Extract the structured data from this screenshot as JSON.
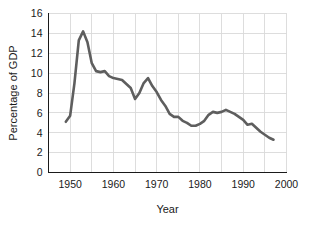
{
  "chart_data": {
    "type": "line",
    "title": "",
    "xlabel": "Year",
    "ylabel": "Percentage of GDP",
    "xlim": [
      1945,
      2000
    ],
    "ylim": [
      0,
      16
    ],
    "grid": true,
    "legend": false,
    "line_color": "#5e5e5e",
    "grid_color": "#d9d9d9",
    "axis_color": "#1a1a1a",
    "background_color": "#ffffff",
    "x_ticks": [
      1950,
      1960,
      1970,
      1980,
      1990,
      2000
    ],
    "x_tick_labels": [
      "1950",
      "1960",
      "1970",
      "1980",
      "1990",
      "2000"
    ],
    "x_minor_gridlines": [
      1945,
      1950,
      1955,
      1960,
      1965,
      1970,
      1975,
      1980,
      1985,
      1990,
      1995,
      2000
    ],
    "y_ticks": [
      0,
      2,
      4,
      6,
      8,
      10,
      12,
      14,
      16
    ],
    "y_tick_labels": [
      "0",
      "2",
      "4",
      "6",
      "8",
      "10",
      "12",
      "14",
      "16"
    ],
    "series": [
      {
        "name": "Defense spending",
        "x": [
          1949,
          1950,
          1951,
          1952,
          1953,
          1954,
          1955,
          1956,
          1957,
          1958,
          1959,
          1960,
          1961,
          1962,
          1963,
          1964,
          1965,
          1966,
          1967,
          1968,
          1969,
          1970,
          1971,
          1972,
          1973,
          1974,
          1975,
          1976,
          1977,
          1978,
          1979,
          1980,
          1981,
          1982,
          1983,
          1984,
          1985,
          1986,
          1987,
          1988,
          1989,
          1990,
          1991,
          1992,
          1993,
          1994,
          1995,
          1996,
          1997
        ],
        "values": [
          5.1,
          5.7,
          9.0,
          13.3,
          14.2,
          13.1,
          11.0,
          10.2,
          10.1,
          10.2,
          9.7,
          9.5,
          9.4,
          9.3,
          8.9,
          8.5,
          7.4,
          8.0,
          9.0,
          9.5,
          8.7,
          8.1,
          7.3,
          6.7,
          5.9,
          5.6,
          5.6,
          5.2,
          5.0,
          4.7,
          4.7,
          4.9,
          5.2,
          5.8,
          6.1,
          6.0,
          6.1,
          6.3,
          6.1,
          5.9,
          5.6,
          5.3,
          4.8,
          4.9,
          4.5,
          4.1,
          3.8,
          3.5,
          3.3
        ]
      }
    ]
  }
}
